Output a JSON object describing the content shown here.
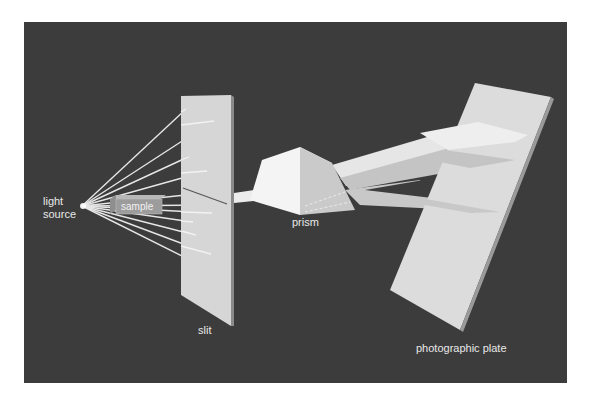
{
  "colors": {
    "page_background": "#ffffff",
    "panel_background": "#3c3c3c",
    "slit_face": "#d6d6d6",
    "slit_edge": "#8a8a8a",
    "prism_top": "#f4f4f4",
    "prism_side": "#c8c8c8",
    "plate_face": "#dcdcdc",
    "plate_edge": "#9a9a9a",
    "ray": "#f0f0f0",
    "beam_light": "#e6e6e6",
    "beam_mid": "#c4c4c4",
    "beam_dark": "#a8a8a8",
    "label": "#e8e8e8"
  },
  "labels": {
    "light_source_line1": "light",
    "light_source_line2": "source",
    "sample": "sample",
    "slit": "slit",
    "prism": "prism",
    "photographic_plate": "photographic plate"
  },
  "components": [
    {
      "id": "light-source",
      "label": "light source"
    },
    {
      "id": "sample",
      "label": "sample"
    },
    {
      "id": "slit",
      "label": "slit"
    },
    {
      "id": "prism",
      "label": "prism"
    },
    {
      "id": "photographic-plate",
      "label": "photographic plate"
    }
  ]
}
